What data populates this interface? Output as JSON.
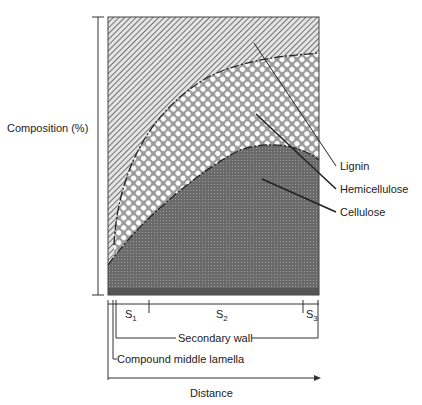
{
  "diagram": {
    "y_axis_label": "Composition (%)",
    "x_axis_label": "Distance",
    "regions": [
      {
        "name": "Lignin",
        "pattern": "diagonal-hatch"
      },
      {
        "name": "Hemicellulose",
        "pattern": "crosshatch-circles"
      },
      {
        "name": "Cellulose",
        "pattern": "dark-dotted"
      }
    ],
    "labels": {
      "lignin": "Lignin",
      "hemicellulose": "Hemicellulose",
      "cellulose": "Cellulose"
    },
    "layers": {
      "s1": "S",
      "s1_sub": "1",
      "s2": "S",
      "s2_sub": "2",
      "s3": "S",
      "s3_sub": "3",
      "secondary_wall": "Secondary wall",
      "compound_middle_lamella": "Compound middle lamella"
    }
  }
}
